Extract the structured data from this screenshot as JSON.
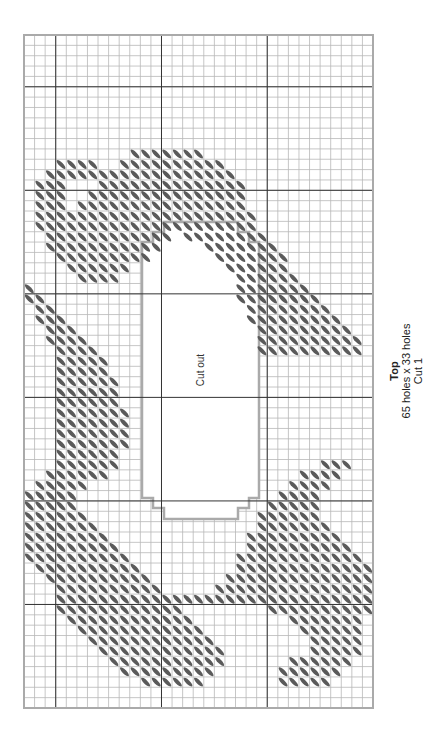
{
  "pattern": {
    "title": "Top",
    "size": "65 holes x 33 holes",
    "cut": "Cut 1",
    "cutout_label": "Cut out",
    "cols": 33,
    "rows": 65,
    "grid": {
      "left": 24,
      "top": 35,
      "right": 373,
      "bottom": 708
    },
    "colors": {
      "minor_line": "#b8b8b8",
      "major_line": "#333333",
      "border": "#aaaaaa",
      "stitch": "#5a5a5a",
      "cutout_border": "#aaaaaa"
    },
    "cutout_outline": [
      [
        164,
        222
      ],
      [
        238,
        222
      ],
      [
        238,
        232
      ],
      [
        249,
        232
      ],
      [
        249,
        242
      ],
      [
        259,
        242
      ],
      [
        259,
        498
      ],
      [
        249,
        498
      ],
      [
        249,
        508
      ],
      [
        238,
        508
      ],
      [
        238,
        519
      ],
      [
        164,
        519
      ],
      [
        164,
        508
      ],
      [
        153,
        508
      ],
      [
        153,
        498
      ],
      [
        142,
        498
      ],
      [
        142,
        242
      ],
      [
        153,
        242
      ],
      [
        153,
        232
      ],
      [
        164,
        232
      ]
    ],
    "stitch_rows": {
      "11": [
        [
          10,
          16
        ]
      ],
      "12": [
        [
          3,
          6
        ],
        [
          9,
          18
        ]
      ],
      "13": [
        [
          2,
          7
        ],
        [
          8,
          19
        ]
      ],
      "14": [
        [
          1,
          3
        ],
        [
          7,
          20
        ]
      ],
      "15": [
        [
          1,
          3
        ],
        [
          6,
          20
        ]
      ],
      "16": [
        [
          1,
          3
        ],
        [
          5,
          20
        ]
      ],
      "17": [
        [
          1,
          4
        ],
        [
          5,
          21
        ]
      ],
      "18": [
        [
          1,
          21
        ]
      ],
      "19": [
        [
          2,
          13
        ],
        [
          15,
          22
        ]
      ],
      "20": [
        [
          2,
          12
        ],
        [
          17,
          23
        ]
      ],
      "21": [
        [
          3,
          11
        ],
        [
          18,
          24
        ]
      ],
      "22": [
        [
          4,
          9
        ],
        [
          19,
          24
        ]
      ],
      "23": [
        [
          5,
          8
        ],
        [
          20,
          25
        ]
      ],
      "24": [
        [
          0,
          0
        ],
        [
          20,
          26
        ]
      ],
      "25": [
        [
          0,
          1
        ],
        [
          20,
          27
        ]
      ],
      "26": [
        [
          1,
          2
        ],
        [
          21,
          28
        ]
      ],
      "27": [
        [
          1,
          3
        ],
        [
          21,
          29
        ]
      ],
      "28": [
        [
          2,
          4
        ],
        [
          22,
          30
        ]
      ],
      "29": [
        [
          2,
          5
        ],
        [
          22,
          31
        ]
      ],
      "30": [
        [
          3,
          6
        ],
        [
          22,
          31
        ]
      ],
      "31": [
        [
          3,
          7
        ]
      ],
      "32": [
        [
          3,
          7
        ]
      ],
      "33": [
        [
          3,
          8
        ]
      ],
      "34": [
        [
          3,
          8
        ]
      ],
      "35": [
        [
          3,
          8
        ]
      ],
      "36": [
        [
          3,
          9
        ]
      ],
      "37": [
        [
          3,
          9
        ]
      ],
      "38": [
        [
          3,
          9
        ]
      ],
      "39": [
        [
          3,
          9
        ]
      ],
      "40": [
        [
          3,
          8
        ]
      ],
      "41": [
        [
          3,
          8
        ],
        [
          28,
          30
        ]
      ],
      "42": [
        [
          2,
          7
        ],
        [
          26,
          29
        ]
      ],
      "43": [
        [
          1,
          5
        ],
        [
          25,
          28
        ]
      ],
      "44": [
        [
          0,
          4
        ],
        [
          24,
          27
        ]
      ],
      "45": [
        [
          0,
          4
        ],
        [
          23,
          27
        ]
      ],
      "46": [
        [
          0,
          5
        ],
        [
          22,
          27
        ]
      ],
      "47": [
        [
          0,
          6
        ],
        [
          22,
          28
        ]
      ],
      "48": [
        [
          0,
          7
        ],
        [
          21,
          29
        ]
      ],
      "49": [
        [
          0,
          8
        ],
        [
          21,
          30
        ]
      ],
      "50": [
        [
          0,
          9
        ],
        [
          20,
          31
        ]
      ],
      "51": [
        [
          1,
          10
        ],
        [
          20,
          32
        ]
      ],
      "52": [
        [
          2,
          11
        ],
        [
          19,
          32
        ]
      ],
      "53": [
        [
          3,
          12
        ],
        [
          18,
          32
        ]
      ],
      "54": [
        [
          3,
          32
        ]
      ],
      "55": [
        [
          3,
          14
        ],
        [
          23,
          32
        ]
      ],
      "56": [
        [
          4,
          15
        ],
        [
          25,
          31
        ]
      ],
      "57": [
        [
          5,
          16
        ],
        [
          26,
          31
        ]
      ],
      "58": [
        [
          6,
          17
        ],
        [
          27,
          31
        ]
      ],
      "59": [
        [
          7,
          18
        ],
        [
          27,
          31
        ]
      ],
      "60": [
        [
          8,
          18
        ],
        [
          25,
          30
        ]
      ],
      "61": [
        [
          9,
          17
        ],
        [
          24,
          29
        ]
      ],
      "62": [
        [
          11,
          16
        ],
        [
          24,
          28
        ]
      ]
    },
    "cutout_rows": [
      18,
      47
    ],
    "cutout_cols": [
      11,
      22
    ]
  }
}
